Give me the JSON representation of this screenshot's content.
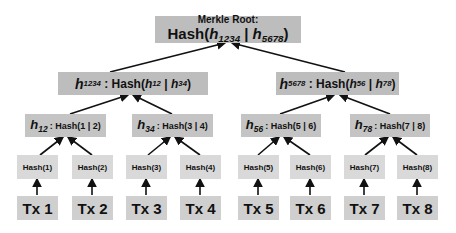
{
  "root": {
    "label": "Merkle Root:",
    "hash_prefix": "Hash(",
    "left_var": "h",
    "left_sub": "1234",
    "separator": " | ",
    "right_var": "h",
    "right_sub": "5678",
    "suffix": ")"
  },
  "level2": [
    {
      "var": "h",
      "sub": "1234",
      "colon": " : ",
      "hash_prefix": "Hash(",
      "a_var": "h",
      "a_sub": "12",
      "sep": " | ",
      "b_var": "h",
      "b_sub": "34",
      "suffix": ")"
    },
    {
      "var": "h",
      "sub": "5678",
      "colon": " : ",
      "hash_prefix": "Hash(",
      "a_var": "h",
      "a_sub": "56",
      "sep": " | ",
      "b_var": "h",
      "b_sub": "78",
      "suffix": ")"
    }
  ],
  "level3": [
    {
      "var": "h",
      "sub": "12",
      "colon": ":",
      "expr": "Hash(1 | 2)"
    },
    {
      "var": "h",
      "sub": "34",
      "colon": ":",
      "expr": "Hash(3 | 4)"
    },
    {
      "var": "h",
      "sub": "56",
      "colon": ":",
      "expr": "Hash(5 | 6)"
    },
    {
      "var": "h",
      "sub": "78",
      "colon": ":",
      "expr": "Hash(7 | 8)"
    }
  ],
  "leaf_hashes": [
    "Hash(1)",
    "Hash(2)",
    "Hash(3)",
    "Hash(4)",
    "Hash(5)",
    "Hash(6)",
    "Hash(7)",
    "Hash(8)"
  ],
  "transactions": [
    "Tx 1",
    "Tx 2",
    "Tx 3",
    "Tx 4",
    "Tx 5",
    "Tx 6",
    "Tx 7",
    "Tx 8"
  ],
  "colors": {
    "root_box": "#bdbdbd",
    "level2_box": "#bdbdbd",
    "level3_box": "#c4c4c4",
    "leaf_box": "#d9d9d9",
    "tx_box": "#cfcfcf",
    "arrow": "#111111"
  }
}
